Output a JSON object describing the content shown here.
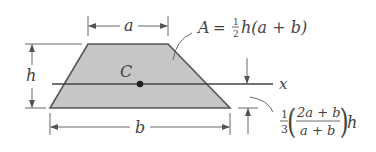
{
  "diagram": {
    "shape": "trapezoid",
    "colors": {
      "fill": "#c6c6c6",
      "stroke": "#555555",
      "dim": "#666666",
      "text": "#444444"
    },
    "labels": {
      "top_width": "a",
      "bottom_width": "b",
      "height": "h",
      "centroid": "C",
      "axis": "x",
      "area_formula": "A = ½h(a + b)",
      "area_lhs": "A",
      "area_eq": "=",
      "area_frac_num": "1",
      "area_frac_den": "2",
      "area_rhs": "h(a + b)",
      "centroid_coef_num": "1",
      "centroid_coef_den": "3",
      "centroid_frac_num": "2a + b",
      "centroid_frac_den": "a + b",
      "centroid_suffix": "h",
      "centroid_formula": "⅓((2a + b)/(a + b))h"
    }
  }
}
